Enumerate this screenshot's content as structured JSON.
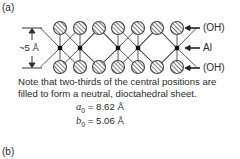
{
  "panel_a": {
    "label": "(a)",
    "dimension_label": "~5 Å",
    "layers": [
      {
        "label": "(OH)",
        "y": 28
      },
      {
        "label": "Al",
        "y": 48
      },
      {
        "label": "(OH)",
        "y": 67
      }
    ],
    "top_oh_x": [
      60,
      80,
      99,
      118,
      138,
      157,
      177
    ],
    "bottom_oh_x": [
      60,
      80,
      99,
      118,
      138,
      157,
      177
    ],
    "al_positions": [
      {
        "x": 60,
        "filled": true
      },
      {
        "x": 80,
        "filled": true
      },
      {
        "x": 99,
        "filled": false
      },
      {
        "x": 118,
        "filled": true
      },
      {
        "x": 138,
        "filled": true
      },
      {
        "x": 157,
        "filled": false
      },
      {
        "x": 177,
        "filled": true
      }
    ],
    "note_line1": "Note that two-thirds of the central positions are",
    "note_line2": "filled to form a neutral, dioctahedral sheet.",
    "a0_symbol": "a",
    "a0_sub": "0",
    "a0_value": " = 8.62 Å",
    "b0_symbol": "b",
    "b0_sub": "0",
    "b0_value": " = 5.06 Å"
  },
  "panel_b": {
    "label": "(b)"
  },
  "colors": {
    "ink": "#2a2a2a",
    "line": "#444444"
  }
}
